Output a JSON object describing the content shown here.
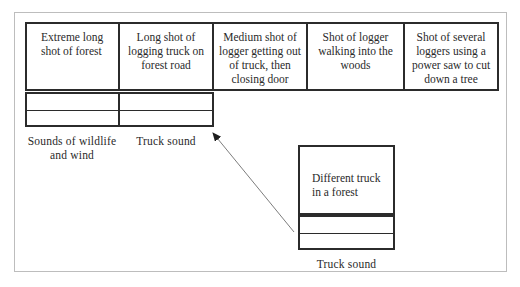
{
  "diagram": {
    "title": "",
    "shots": [
      {
        "id": "shot-1",
        "text": "Extreme long shot of forest"
      },
      {
        "id": "shot-2",
        "text": "Long shot of logging truck on forest road"
      },
      {
        "id": "shot-3",
        "text": "Medium shot of logger getting out of truck, then closing door"
      },
      {
        "id": "shot-4",
        "text": "Shot of logger walking into the woods"
      },
      {
        "id": "shot-5",
        "text": "Shot of several loggers using a power saw to cut down a tree"
      }
    ],
    "audio_tracks": [
      {
        "id": "audio-1",
        "label": "Sounds of wildlife and wind"
      },
      {
        "id": "audio-2",
        "label": "Truck sound"
      }
    ],
    "alternate": {
      "shot_text": "Different truck in a forest",
      "audio_label": "Truck sound"
    },
    "arrow": {
      "from": "alternate-shot",
      "to": "audio-2",
      "color": "#6e6e6e"
    },
    "colors": {
      "box_border": "#2b2b2b",
      "frame_border": "#bdbdbd",
      "text": "#2a2a2a"
    }
  }
}
